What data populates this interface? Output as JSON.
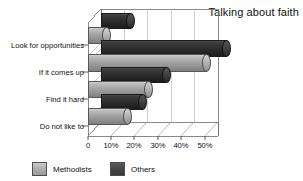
{
  "chart_data": {
    "type": "bar",
    "title": "Talking about faith",
    "xlabel": "",
    "ylabel": "",
    "orientation": "horizontal",
    "style": "3d-cylinder",
    "grid": true,
    "legend_position": "bottom-left",
    "categories": [
      "Look for opportunities",
      "If it comes up",
      "Find it hard",
      "Do not like to"
    ],
    "series": [
      {
        "name": "Methodists",
        "color": "#ababab",
        "values": [
          8,
          51,
          26,
          17
        ]
      },
      {
        "name": "Others",
        "color": "#444444",
        "values": [
          13,
          54,
          28,
          18
        ]
      }
    ],
    "xlim": [
      0,
      57
    ],
    "xticks": [
      0,
      10,
      20,
      30,
      40,
      50
    ],
    "xtick_labels": [
      "0",
      "10%",
      "20%",
      "30%",
      "40%",
      "50%"
    ]
  },
  "legend": {
    "items": [
      {
        "label": "Methodists",
        "swatch": "light-gray-swatch"
      },
      {
        "label": "Others",
        "swatch": "dark-gray-swatch"
      }
    ]
  }
}
